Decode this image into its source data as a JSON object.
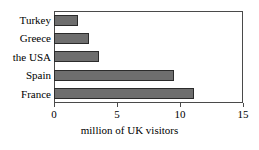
{
  "chart_data": {
    "type": "bar",
    "orientation": "horizontal",
    "title": "",
    "xlabel": "million of UK visitors",
    "ylabel": "",
    "categories": [
      "Turkey",
      "Greece",
      "the USA",
      "Spain",
      "France"
    ],
    "values": [
      1.9,
      2.8,
      3.6,
      9.5,
      11.1
    ],
    "xlim": [
      0,
      15
    ],
    "xticks": [
      0,
      5,
      10,
      15
    ],
    "xtick_labels": [
      "0",
      "5",
      "10",
      "15"
    ],
    "grid": false,
    "legend": null,
    "series": [
      {
        "name": "million of UK visitors",
        "values": [
          1.9,
          2.8,
          3.6,
          9.5,
          11.1
        ]
      }
    ],
    "colors": {
      "bar_fill": "#6e6e6e",
      "bar_edge": "#2b2b2b",
      "frame": "#4a4a4a",
      "text": "#000000",
      "background": "#ffffff"
    }
  }
}
